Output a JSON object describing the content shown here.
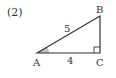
{
  "problem": {
    "number": "(2)"
  },
  "triangle": {
    "vertices": {
      "A": "A",
      "B": "B",
      "C": "C"
    },
    "sides": {
      "AB": "5",
      "AC": "4"
    },
    "right_angle_at": "C",
    "marked_angle_at": "A"
  },
  "colors": {
    "stroke": "#333333",
    "angle_fill": "#bfbfbf"
  }
}
